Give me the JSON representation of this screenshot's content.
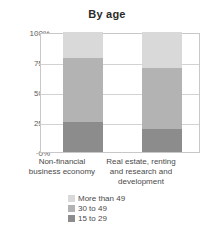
{
  "chart_data": {
    "type": "bar",
    "stacked": true,
    "title": "By age",
    "xlabel": "",
    "ylabel": "",
    "ylim": [
      0,
      100
    ],
    "yunit": "%",
    "grid": true,
    "legend_position": "bottom",
    "categories": [
      "Non-financial business economy",
      "Real estate, renting and research and development"
    ],
    "category_label_lines": [
      [
        "Non-financial",
        "business economy"
      ],
      [
        "Real estate, renting",
        "and research and",
        "development"
      ]
    ],
    "ticks": [
      "100%",
      "75%",
      "50%",
      "25%",
      "0%"
    ],
    "tick_values": [
      100,
      75,
      50,
      25,
      0
    ],
    "series": [
      {
        "name": "More than 49",
        "color": "#d9d9d9",
        "values": [
          22,
          30
        ]
      },
      {
        "name": "30 to 49",
        "color": "#b3b3b3",
        "values": [
          53,
          51
        ]
      },
      {
        "name": "15 to 29",
        "color": "#8c8c8c",
        "values": [
          25,
          19
        ]
      }
    ]
  }
}
